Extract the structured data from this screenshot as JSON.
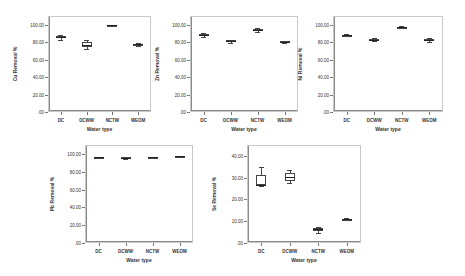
{
  "chart_data": [
    {
      "type": "box",
      "title": "",
      "xlabel": "Water type",
      "ylabel": "Cu Removal %",
      "ylim": [
        0,
        110
      ],
      "yticks": [
        ".00",
        "20.00",
        "40.00",
        "60.00",
        "80.00",
        "100.00"
      ],
      "categories": [
        "DC",
        "DCWW",
        "NCTW",
        "WEOM"
      ],
      "series": [
        {
          "category": "DC",
          "min": 83,
          "q1": 85,
          "median": 86,
          "q3": 87,
          "max": 88
        },
        {
          "category": "DCWW",
          "min": 72,
          "q1": 74,
          "median": 77,
          "q3": 80,
          "max": 83
        },
        {
          "category": "NCTW",
          "min": 99,
          "q1": 99.5,
          "median": 99.7,
          "q3": 99.9,
          "max": 100
        },
        {
          "category": "WEOM",
          "min": 76,
          "q1": 77,
          "median": 77.5,
          "q3": 78,
          "max": 79
        }
      ]
    },
    {
      "type": "box",
      "title": "",
      "xlabel": "Water type",
      "ylabel": "Zn Removal %",
      "ylim": [
        0,
        110
      ],
      "yticks": [
        ".00",
        "20.00",
        "40.00",
        "60.00",
        "80.00",
        "100.00"
      ],
      "categories": [
        "DC",
        "DCWW",
        "NCTW",
        "WEOM"
      ],
      "series": [
        {
          "category": "DC",
          "min": 86,
          "q1": 87,
          "median": 88,
          "q3": 89,
          "max": 90
        },
        {
          "category": "DCWW",
          "min": 79,
          "q1": 80,
          "median": 81,
          "q3": 82,
          "max": 83
        },
        {
          "category": "NCTW",
          "min": 92,
          "q1": 93,
          "median": 94,
          "q3": 95,
          "max": 96
        },
        {
          "category": "WEOM",
          "min": 79.5,
          "q1": 80,
          "median": 80.5,
          "q3": 81,
          "max": 81.5
        }
      ]
    },
    {
      "type": "box",
      "title": "",
      "xlabel": "Water type",
      "ylabel": "Ni Removal %",
      "ylim": [
        0,
        110
      ],
      "yticks": [
        ".00",
        "20.00",
        "40.00",
        "60.00",
        "80.00",
        "100.00"
      ],
      "categories": [
        "DC",
        "DCWW",
        "NCTW",
        "WEOM"
      ],
      "series": [
        {
          "category": "DC",
          "min": 87,
          "q1": 87.5,
          "median": 88,
          "q3": 88.5,
          "max": 89
        },
        {
          "category": "DCWW",
          "min": 81,
          "q1": 82,
          "median": 83,
          "q3": 84,
          "max": 85
        },
        {
          "category": "NCTW",
          "min": 96,
          "q1": 96.5,
          "median": 97,
          "q3": 97.5,
          "max": 98
        },
        {
          "category": "WEOM",
          "min": 80,
          "q1": 81.5,
          "median": 82.5,
          "q3": 83.5,
          "max": 85
        }
      ]
    },
    {
      "type": "box",
      "title": "",
      "xlabel": "Water type",
      "ylabel": "Pb Removal %",
      "ylim": [
        0,
        110
      ],
      "yticks": [
        ".00",
        "20.00",
        "40.00",
        "60.00",
        "80.00",
        "100.00"
      ],
      "categories": [
        "DC",
        "DCWW",
        "NCTW",
        "WEOM"
      ],
      "series": [
        {
          "category": "DC",
          "min": 95,
          "q1": 95.5,
          "median": 96,
          "q3": 96.3,
          "max": 96.6
        },
        {
          "category": "DCWW",
          "min": 94.5,
          "q1": 95,
          "median": 95.5,
          "q3": 96,
          "max": 96.5
        },
        {
          "category": "NCTW",
          "min": 95.5,
          "q1": 95.8,
          "median": 96,
          "q3": 96.2,
          "max": 96.4
        },
        {
          "category": "WEOM",
          "min": 96.5,
          "q1": 97,
          "median": 97.3,
          "q3": 97.6,
          "max": 98
        }
      ]
    },
    {
      "type": "box",
      "title": "",
      "xlabel": "Water type",
      "ylabel": "Se Removal %",
      "ylim": [
        0,
        45
      ],
      "yticks": [
        ".00",
        "10.00",
        "20.00",
        "30.00",
        "40.00"
      ],
      "categories": [
        "DC",
        "DCWW",
        "NCTW",
        "WEOM"
      ],
      "series": [
        {
          "category": "DC",
          "min": 26,
          "q1": 26.5,
          "median": 26.8,
          "q3": 31,
          "max": 35
        },
        {
          "category": "DCWW",
          "min": 27.5,
          "q1": 28.5,
          "median": 30.5,
          "q3": 32,
          "max": 33.5
        },
        {
          "category": "NCTW",
          "min": 4.5,
          "q1": 5.5,
          "median": 6.5,
          "q3": 7,
          "max": 7.5
        },
        {
          "category": "WEOM",
          "min": 10.5,
          "q1": 10.8,
          "median": 11,
          "q3": 11.2,
          "max": 11.5
        }
      ]
    }
  ]
}
